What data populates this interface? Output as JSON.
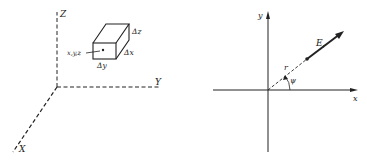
{
  "left_diagram": {
    "axes": {
      "z": "Z",
      "y": "Y",
      "x": "X"
    },
    "point_label": "x,y,z",
    "box_labels": {
      "dz": "Δz",
      "dx": "Δx",
      "dy": "Δy"
    }
  },
  "right_diagram": {
    "axes": {
      "y": "y",
      "x": "x"
    },
    "radius_label": "r",
    "angle_label": "ψ",
    "field_label": "E",
    "field_subscript": "r"
  },
  "colors": {
    "ink": "#222222",
    "background": "#ffffff"
  }
}
